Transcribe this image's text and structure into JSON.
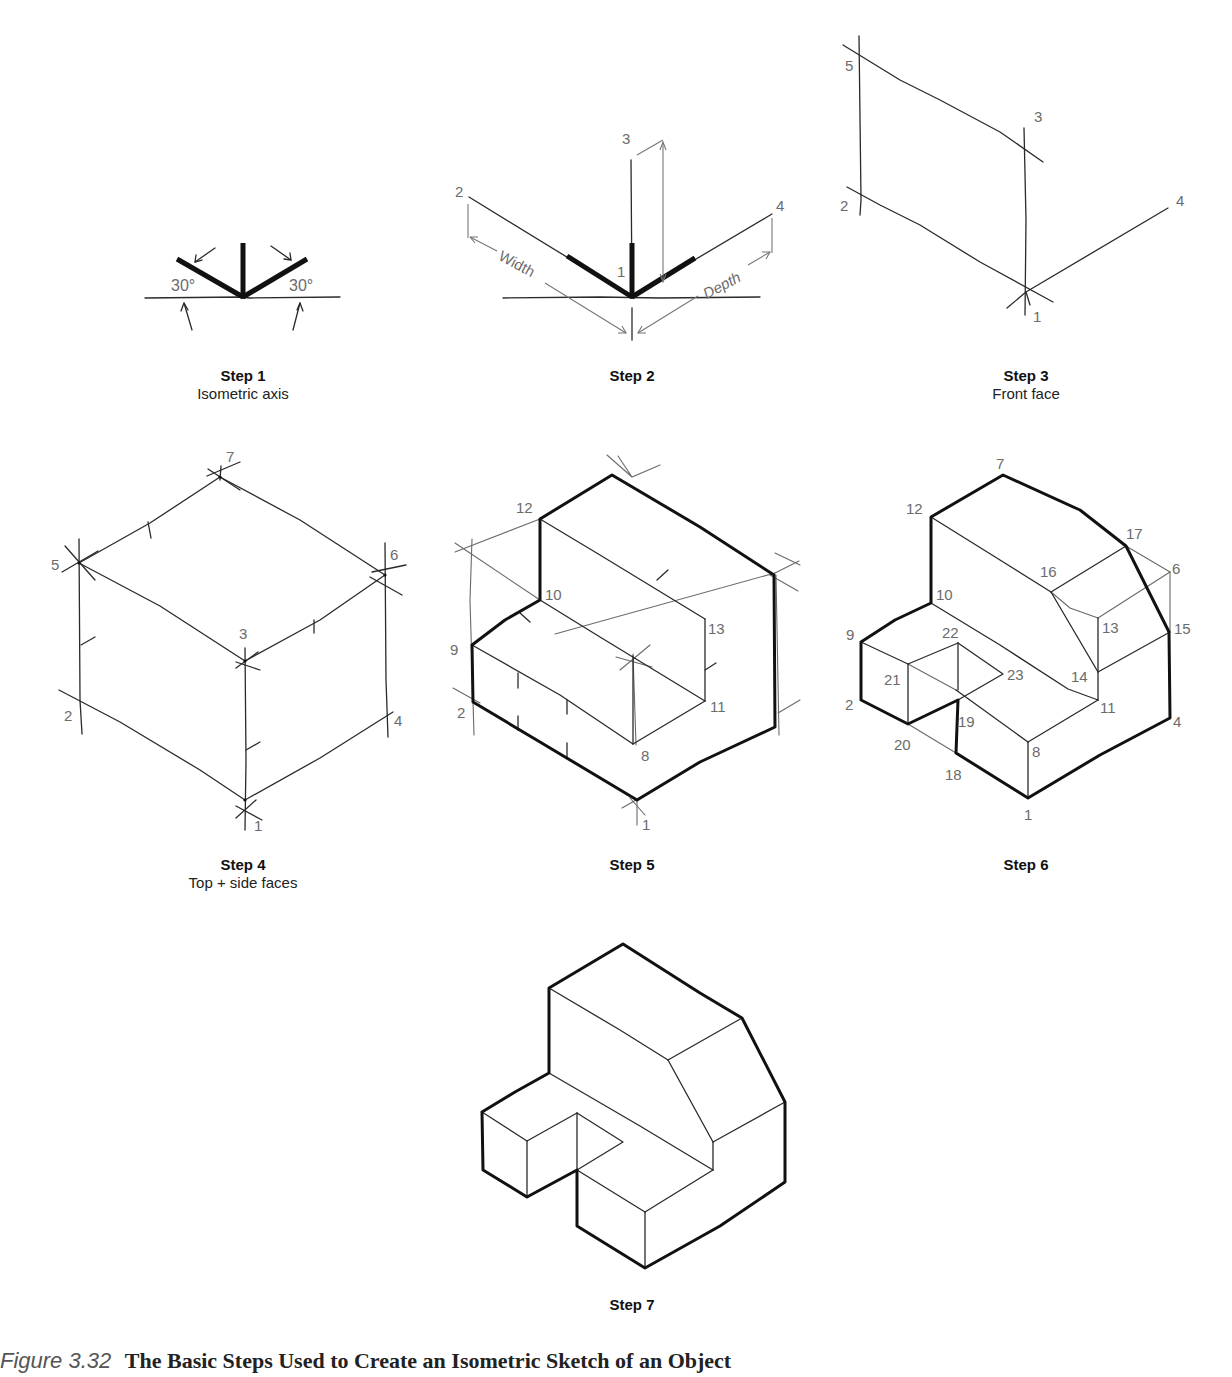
{
  "figure": {
    "caption_number": "Figure 3.32",
    "caption_title": "The Basic Steps Used to Create an Isometric Sketch of an Object",
    "caption_visible": "partially (cropped at bottom edge)"
  },
  "steps": [
    {
      "id": "step1",
      "title": "Step 1",
      "subtitle": "Isometric axis",
      "annotations": {
        "angle_left": "30°",
        "angle_right": "30°"
      }
    },
    {
      "id": "step2",
      "title": "Step 2",
      "subtitle": "",
      "points": {
        "p1": "1",
        "p2": "2",
        "p3": "3",
        "p4": "4"
      },
      "dimensions": {
        "width": "Width",
        "depth": "Depth"
      }
    },
    {
      "id": "step3",
      "title": "Step 3",
      "subtitle": "Front face",
      "points": {
        "p1": "1",
        "p2": "2",
        "p3": "3",
        "p4": "4",
        "p5": "5"
      }
    },
    {
      "id": "step4",
      "title": "Step 4",
      "subtitle": "Top + side faces",
      "points": {
        "p1": "1",
        "p2": "2",
        "p3": "3",
        "p4": "4",
        "p5": "5",
        "p6": "6",
        "p7": "7"
      }
    },
    {
      "id": "step5",
      "title": "Step 5",
      "subtitle": "",
      "points": {
        "p1": "1",
        "p2": "2",
        "p8": "8",
        "p9": "9",
        "p10": "10",
        "p11": "11",
        "p12": "12",
        "p13": "13"
      }
    },
    {
      "id": "step6",
      "title": "Step 6",
      "subtitle": "",
      "points": {
        "p1": "1",
        "p2": "2",
        "p4": "4",
        "p6": "6",
        "p7": "7",
        "p8": "8",
        "p9": "9",
        "p10": "10",
        "p11": "11",
        "p12": "12",
        "p13": "13",
        "p14": "14",
        "p15": "15",
        "p16": "16",
        "p17": "17",
        "p18": "18",
        "p19": "19",
        "p20": "20",
        "p21": "21",
        "p22": "22",
        "p23": "23"
      }
    },
    {
      "id": "step7",
      "title": "Step 7",
      "subtitle": ""
    }
  ],
  "colors": {
    "line_dark": "#111111",
    "construction": "#6a6a6a",
    "label_gray": "#6b6b6b",
    "background": "#ffffff"
  }
}
